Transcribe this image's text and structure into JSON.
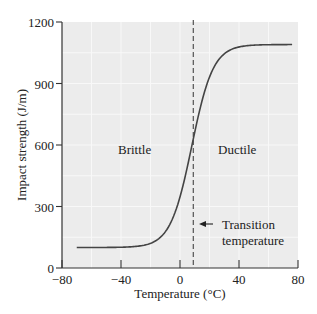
{
  "chart_data": {
    "type": "line",
    "title": "",
    "xlabel": "Temperature (°C)",
    "ylabel": "Impact strength (J/m)",
    "xlim": [
      -80,
      80
    ],
    "ylim": [
      0,
      1200
    ],
    "xticks": [
      -80,
      -40,
      0,
      40,
      80
    ],
    "yticks": [
      0,
      300,
      600,
      900,
      1200
    ],
    "xtick_labels": [
      "−80",
      "−40",
      "0",
      "40",
      "80"
    ],
    "ytick_labels": [
      "0",
      "300",
      "600",
      "900",
      "1200"
    ],
    "grid": true,
    "series": [
      {
        "name": "Impact strength",
        "x": [
          -70,
          -60,
          -50,
          -40,
          -30,
          -20,
          -10,
          0,
          5,
          8,
          10,
          15,
          20,
          30,
          40,
          50,
          60,
          70,
          76
        ],
        "values": [
          100,
          100,
          101,
          105,
          118,
          150,
          230,
          390,
          520,
          600,
          660,
          800,
          910,
          1030,
          1075,
          1087,
          1090,
          1090,
          1090
        ]
      }
    ],
    "annotations": [
      {
        "type": "vline",
        "x": 9,
        "style": "dashed",
        "label": "Transition temperature"
      },
      {
        "type": "text",
        "text": "Brittle",
        "x": -22,
        "y": 650
      },
      {
        "type": "text",
        "text": "Ductile",
        "x": 40,
        "y": 650
      },
      {
        "type": "arrow",
        "text": "Transition temperature",
        "from_x": 20,
        "to_x": 10,
        "y": 215
      }
    ],
    "legend": null
  },
  "labels": {
    "brittle": "Brittle",
    "ductile": "Ductile",
    "transition_line1": "Transition",
    "transition_line2": "temperature"
  },
  "colors": {
    "plot_background": "#ececec",
    "gridline": "#f8f8f8",
    "curve": "#444444",
    "axis": "#333333"
  }
}
